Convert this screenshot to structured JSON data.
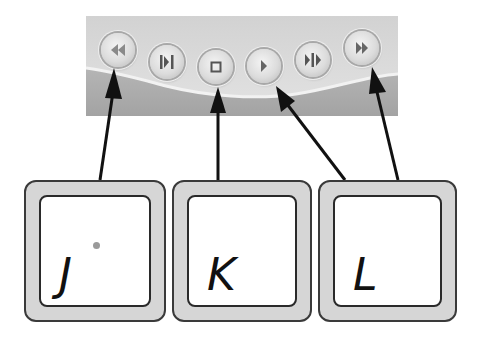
{
  "colors": {
    "panel_top": "#d9d9d9",
    "panel_band": "#a9a9a9",
    "arrow": "#111111",
    "key_rim": "#d6d6d6",
    "key_face": "#ffffff",
    "key_dot": "#9a9a9a"
  },
  "transport_controls": {
    "buttons": [
      {
        "id": "rewind",
        "icon": "rewind-icon",
        "glyph": "double-left-triangle"
      },
      {
        "id": "step-back",
        "icon": "step-back-icon",
        "glyph": "bar-triangle-bar"
      },
      {
        "id": "stop",
        "icon": "stop-icon",
        "glyph": "square"
      },
      {
        "id": "play",
        "icon": "play-icon",
        "glyph": "right-triangle"
      },
      {
        "id": "step-forward",
        "icon": "step-forward-icon",
        "glyph": "triangle-bar-triangle"
      },
      {
        "id": "fast-forward",
        "icon": "fast-forward-icon",
        "glyph": "double-right-triangle"
      }
    ]
  },
  "keys": [
    {
      "letter": "J",
      "maps_to": [
        "rewind"
      ],
      "has_dot": true
    },
    {
      "letter": "K",
      "maps_to": [
        "stop"
      ],
      "has_dot": false
    },
    {
      "letter": "L",
      "maps_to": [
        "play",
        "fast-forward"
      ],
      "has_dot": false
    }
  ]
}
